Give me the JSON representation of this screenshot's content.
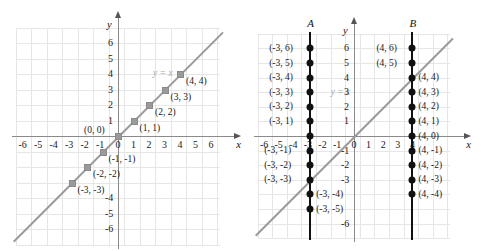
{
  "figure": {
    "top_fragment": "",
    "left_panel": {
      "name": "graph-y-equals-x",
      "equation_label": "y = x",
      "axis_x_name": "x",
      "axis_y_name": "y",
      "x_ticks": [
        "-6",
        "-5",
        "-4",
        "-3",
        "-2",
        "-1",
        "0",
        "1",
        "2",
        "3",
        "4",
        "5",
        "6"
      ],
      "y_ticks_positive": [
        "1",
        "2",
        "3",
        "4",
        "5",
        "6"
      ],
      "y_ticks_negative": [
        "-4",
        "-5",
        "-6"
      ],
      "points": [
        {
          "x": -3,
          "y": -3,
          "label": "(-3, -3)",
          "side": "right"
        },
        {
          "x": -2,
          "y": -2,
          "label": "(-2, -2)",
          "side": "right"
        },
        {
          "x": -1,
          "y": -1,
          "label": "(-1, -1)",
          "side": "right"
        },
        {
          "x": 0,
          "y": 0,
          "label": "(0, 0)",
          "side": "left"
        },
        {
          "x": 1,
          "y": 1,
          "label": "(1, 1)",
          "side": "right"
        },
        {
          "x": 2,
          "y": 2,
          "label": "(2, 2)",
          "side": "right"
        },
        {
          "x": 3,
          "y": 3,
          "label": "(3, 3)",
          "side": "right"
        },
        {
          "x": 4,
          "y": 4,
          "label": "(4, 4)",
          "side": "right"
        }
      ]
    },
    "right_panel": {
      "name": "graph-vertical-lines",
      "equation_label": "y = x",
      "axis_x_name": "x",
      "axis_y_name": "y",
      "line_a_name": "A",
      "line_b_name": "B",
      "line_a_x": -3,
      "line_b_x": 4,
      "x_ticks": [
        "-6",
        "-5",
        "-4",
        "-3",
        "-2",
        "-1",
        "0",
        "1",
        "2",
        "3",
        "4"
      ],
      "y_ticks_positive": [
        "1",
        "2",
        "3",
        "4",
        "5",
        "6"
      ],
      "y_ticks_negative": [
        "-1",
        "-2",
        "-3",
        "-6"
      ],
      "line_a_points": [
        {
          "y": 6,
          "label": "(-3, 6)",
          "side": "left"
        },
        {
          "y": 5,
          "label": "(-3, 5)",
          "side": "left"
        },
        {
          "y": 4,
          "label": "(-3, 4)",
          "side": "left"
        },
        {
          "y": 3,
          "label": "(-3, 3)",
          "side": "left"
        },
        {
          "y": 2,
          "label": "(-3, 2)",
          "side": "left"
        },
        {
          "y": 1,
          "label": "(-3, 1)",
          "side": "left"
        },
        {
          "y": 0,
          "label": "",
          "side": "none"
        },
        {
          "y": -1,
          "label": "(-3, -1)",
          "side": "left"
        },
        {
          "y": -2,
          "label": "(-3, -2)",
          "side": "left"
        },
        {
          "y": -3,
          "label": "(-3, -3)",
          "side": "left"
        },
        {
          "y": -4,
          "label": "(-3, -4)",
          "side": "right"
        },
        {
          "y": -5,
          "label": "(-3, -5)",
          "side": "right"
        }
      ],
      "line_b_points": [
        {
          "y": 6,
          "label": "(4, 6)",
          "side": "left"
        },
        {
          "y": 5,
          "label": "(4, 5)",
          "side": "left"
        },
        {
          "y": 4,
          "label": "(4, 4)",
          "side": "right"
        },
        {
          "y": 3,
          "label": "(4, 3)",
          "side": "right"
        },
        {
          "y": 2,
          "label": "(4, 2)",
          "side": "right"
        },
        {
          "y": 1,
          "label": "(4, 1)",
          "side": "right"
        },
        {
          "y": 0,
          "label": "(4, 0)",
          "side": "right"
        },
        {
          "y": -1,
          "label": "(4, -1)",
          "side": "right"
        },
        {
          "y": -2,
          "label": "(4, -2)",
          "side": "right"
        },
        {
          "y": -3,
          "label": "(4, -3)",
          "side": "right"
        },
        {
          "y": -4,
          "label": "(4, -4)",
          "side": "right"
        }
      ]
    }
  },
  "chart_data": {
    "type": "scatter",
    "title": "",
    "xlabel": "x",
    "ylabel": "y",
    "xlim": [
      -7,
      7
    ],
    "ylim": [
      -7,
      7
    ],
    "grid": true,
    "legend": "none",
    "series": [
      {
        "name": "y = x",
        "panel": "left",
        "type": "line",
        "annotation": "y = x",
        "x": [
          -3,
          -2,
          -1,
          0,
          1,
          2,
          3,
          4
        ],
        "values": [
          -3,
          -2,
          -1,
          0,
          1,
          2,
          3,
          4
        ]
      },
      {
        "name": "A",
        "panel": "right",
        "type": "vertical-line",
        "annotation": "A",
        "x": [
          -3,
          -3,
          -3,
          -3,
          -3,
          -3,
          -3,
          -3,
          -3,
          -3,
          -3,
          -3
        ],
        "values": [
          6,
          5,
          4,
          3,
          2,
          1,
          0,
          -1,
          -2,
          -3,
          -4,
          -5
        ]
      },
      {
        "name": "B",
        "panel": "right",
        "type": "vertical-line",
        "annotation": "B",
        "x": [
          4,
          4,
          4,
          4,
          4,
          4,
          4,
          4,
          4,
          4,
          4
        ],
        "values": [
          6,
          5,
          4,
          3,
          2,
          1,
          0,
          -1,
          -2,
          -3,
          -4
        ]
      },
      {
        "name": "y = x reference",
        "panel": "right",
        "type": "line",
        "annotation": "y = x",
        "x": [
          -7,
          7
        ],
        "values": [
          -7,
          7
        ]
      }
    ]
  }
}
